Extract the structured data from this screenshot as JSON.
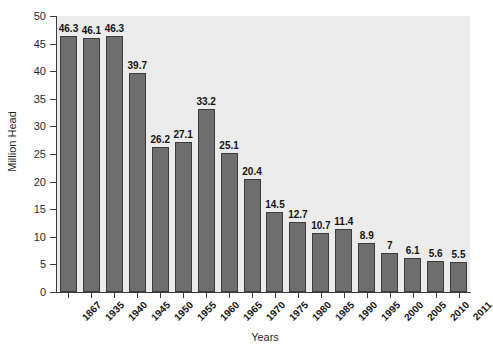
{
  "chart_data": {
    "type": "bar",
    "title": "",
    "xlabel": "Years",
    "ylabel": "Million Head",
    "ylim": [
      0,
      50
    ],
    "ytick_values": [
      0,
      5,
      10,
      15,
      20,
      25,
      30,
      35,
      40,
      45,
      50
    ],
    "ytick_labels": [
      "0",
      "5",
      "10",
      "15",
      "20",
      "25",
      "30",
      "35",
      "40",
      "45",
      "50"
    ],
    "grid": false,
    "legend": null,
    "bar_color": "#6e6e6e",
    "bar_edge_color": "#3c3c3c",
    "plot_background": "#ebebeb",
    "figure_background": "#ffffff",
    "categories": [
      "1867",
      "1935",
      "1940",
      "1945",
      "1950",
      "1955",
      "1960",
      "1965",
      "1970",
      "1975",
      "1980",
      "1985",
      "1990",
      "1995",
      "2000",
      "2005",
      "2010",
      "2011"
    ],
    "values": [
      46.3,
      46.1,
      46.3,
      39.7,
      26.2,
      27.1,
      33.2,
      25.1,
      20.4,
      14.5,
      12.7,
      10.7,
      11.4,
      8.9,
      7,
      6.1,
      5.6,
      5.5
    ],
    "value_labels": [
      "46.3",
      "46.1",
      "46.3",
      "39.7",
      "26.2",
      "27.1",
      "33.2",
      "25.1",
      "20.4",
      "14.5",
      "12.7",
      "10.7",
      "11.4",
      "8.9",
      "7",
      "6.1",
      "5.6",
      "5.5"
    ]
  }
}
